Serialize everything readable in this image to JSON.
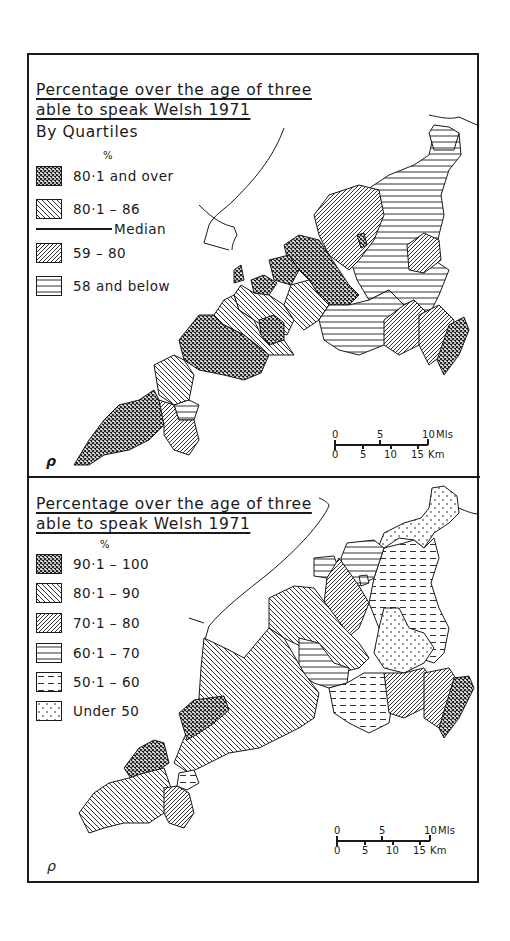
{
  "map_top": {
    "title_line1": "Percentage over the age of three",
    "title_line2": "able to speak Welsh 1971",
    "subtitle": "By Quartiles",
    "unit": "%",
    "legend": [
      {
        "label": "80·1 and over",
        "pattern": "crosshatch"
      },
      {
        "label": "80·1 – 86",
        "pattern": "diagonal-back"
      },
      {
        "label": "59  –  80",
        "pattern": "diagonal-forward"
      },
      {
        "label": "58 and below",
        "pattern": "horizontal"
      }
    ],
    "median_label": "Median",
    "scale": {
      "miles_labels": [
        "0",
        "5",
        "10"
      ],
      "miles_unit": "Mls",
      "km_labels": [
        "0",
        "5",
        "10",
        "15"
      ],
      "km_unit": "Km"
    },
    "north_symbol": "ρ"
  },
  "map_bottom": {
    "title_line1": "Percentage over the age of three",
    "title_line2": "able to speak Welsh 1971",
    "unit": "%",
    "legend": [
      {
        "label": "90·1 – 100",
        "pattern": "crosshatch"
      },
      {
        "label": "80·1 –  90",
        "pattern": "diagonal-back"
      },
      {
        "label": "70·1 –  80",
        "pattern": "diagonal-forward"
      },
      {
        "label": "60·1 –  70",
        "pattern": "horizontal"
      },
      {
        "label": "50·1 –  60",
        "pattern": "dashed-horizontal"
      },
      {
        "label": "Under 50",
        "pattern": "dotted"
      }
    ],
    "scale": {
      "miles_labels": [
        "0",
        "5",
        "10"
      ],
      "miles_unit": "Mls",
      "km_labels": [
        "0",
        "5",
        "10",
        "15"
      ],
      "km_unit": "Km"
    },
    "north_symbol": "ρ"
  },
  "colors": {
    "ink": "#1a1a1a",
    "paper": "#ffffff"
  }
}
